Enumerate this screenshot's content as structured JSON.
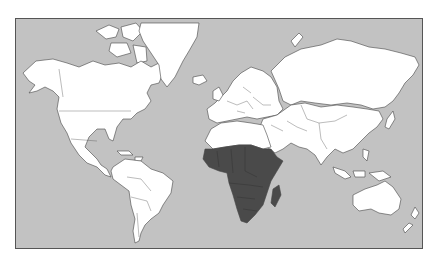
{
  "map": {
    "projection": "mercator",
    "type": "choropleth-world",
    "colors": {
      "ocean": "#c2c2c2",
      "land": "#ffffff",
      "highlight": "#4a4a4a",
      "border": "#444444",
      "frame": "#555555"
    },
    "highlighted_region": "Sub-Saharan Africa",
    "regions": [
      {
        "name": "North America",
        "highlighted": false
      },
      {
        "name": "Greenland",
        "highlighted": false
      },
      {
        "name": "South America",
        "highlighted": false
      },
      {
        "name": "Europe",
        "highlighted": false
      },
      {
        "name": "North Africa",
        "highlighted": false
      },
      {
        "name": "Sub-Saharan Africa",
        "highlighted": true
      },
      {
        "name": "Madagascar",
        "highlighted": true
      },
      {
        "name": "Middle East",
        "highlighted": false
      },
      {
        "name": "Russia / Asia",
        "highlighted": false
      },
      {
        "name": "South / Southeast Asia",
        "highlighted": false
      },
      {
        "name": "Australia",
        "highlighted": false
      },
      {
        "name": "New Zealand",
        "highlighted": false
      }
    ]
  }
}
